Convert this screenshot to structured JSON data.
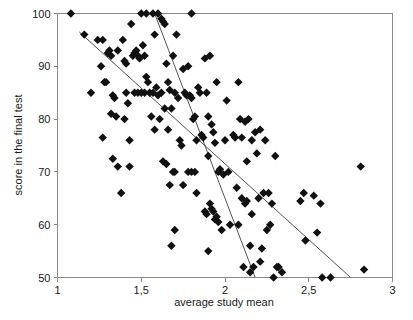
{
  "chart_data": {
    "type": "scatter",
    "title": "",
    "xlabel": "average study mean",
    "ylabel": "score in the final test",
    "xlim": [
      1,
      3
    ],
    "ylim": [
      50,
      100
    ],
    "grid": false,
    "legend": null,
    "x_ticks": [
      "1",
      "1,5",
      "2",
      "2,5",
      "3"
    ],
    "x_tick_values": [
      1,
      1.5,
      2,
      2.5,
      3
    ],
    "y_ticks": [
      "50",
      "60",
      "70",
      "80",
      "90",
      "100"
    ],
    "y_tick_values": [
      50,
      60,
      70,
      80,
      90,
      100
    ],
    "marker": "diamond",
    "marker_color": "#111111",
    "marker_size": 4.2,
    "series": [
      {
        "name": "students",
        "points": [
          [
            1.08,
            100.0
          ],
          [
            1.16,
            96.0
          ],
          [
            1.2,
            85.0
          ],
          [
            1.24,
            95.0
          ],
          [
            1.26,
            90.0
          ],
          [
            1.27,
            95.0
          ],
          [
            1.28,
            87.0
          ],
          [
            1.29,
            87.0
          ],
          [
            1.27,
            76.5
          ],
          [
            1.3,
            92.5
          ],
          [
            1.31,
            93.0
          ],
          [
            1.32,
            92.0
          ],
          [
            1.32,
            81.0
          ],
          [
            1.33,
            84.5
          ],
          [
            1.34,
            84.0
          ],
          [
            1.33,
            72.5
          ],
          [
            1.35,
            80.5
          ],
          [
            1.36,
            93.0
          ],
          [
            1.36,
            71.0
          ],
          [
            1.38,
            66.0
          ],
          [
            1.39,
            95.0
          ],
          [
            1.4,
            91.0
          ],
          [
            1.4,
            80.0
          ],
          [
            1.41,
            90.5
          ],
          [
            1.41,
            85.0
          ],
          [
            1.42,
            83.0
          ],
          [
            1.43,
            76.0
          ],
          [
            1.43,
            71.0
          ],
          [
            1.44,
            98.0
          ],
          [
            1.45,
            92.0
          ],
          [
            1.46,
            92.5
          ],
          [
            1.46,
            85.0
          ],
          [
            1.47,
            93.0
          ],
          [
            1.48,
            92.0
          ],
          [
            1.48,
            85.0
          ],
          [
            1.49,
            91.5
          ],
          [
            1.5,
            100.0
          ],
          [
            1.5,
            85.0
          ],
          [
            1.51,
            94.0
          ],
          [
            1.52,
            92.0
          ],
          [
            1.52,
            85.0
          ],
          [
            1.53,
            100.0
          ],
          [
            1.53,
            88.0
          ],
          [
            1.54,
            87.0
          ],
          [
            1.55,
            85.0
          ],
          [
            1.56,
            80.5
          ],
          [
            1.57,
            100.0
          ],
          [
            1.57,
            85.0
          ],
          [
            1.58,
            96.0
          ],
          [
            1.58,
            78.0
          ],
          [
            1.59,
            86.0
          ],
          [
            1.6,
            100.0
          ],
          [
            1.6,
            84.5
          ],
          [
            1.61,
            80.0
          ],
          [
            1.62,
            99.0
          ],
          [
            1.62,
            85.0
          ],
          [
            1.63,
            98.5
          ],
          [
            1.63,
            72.0
          ],
          [
            1.64,
            98.0
          ],
          [
            1.64,
            82.0
          ],
          [
            1.65,
            90.5
          ],
          [
            1.65,
            71.5
          ],
          [
            1.66,
            87.0
          ],
          [
            1.66,
            78.0
          ],
          [
            1.67,
            85.5
          ],
          [
            1.67,
            67.5
          ],
          [
            1.68,
            82.0
          ],
          [
            1.68,
            56.0
          ],
          [
            1.69,
            92.0
          ],
          [
            1.69,
            70.0
          ],
          [
            1.7,
            85.0
          ],
          [
            1.7,
            70.0
          ],
          [
            1.7,
            59.0
          ],
          [
            1.71,
            96.0
          ],
          [
            1.72,
            84.0
          ],
          [
            1.73,
            76.0
          ],
          [
            1.74,
            75.0
          ],
          [
            1.75,
            89.5
          ],
          [
            1.75,
            67.5
          ],
          [
            1.76,
            85.0
          ],
          [
            1.77,
            84.5
          ],
          [
            1.78,
            90.0
          ],
          [
            1.78,
            70.0
          ],
          [
            1.79,
            84.5
          ],
          [
            1.8,
            100.0
          ],
          [
            1.8,
            84.0
          ],
          [
            1.8,
            70.0
          ],
          [
            1.81,
            80.0
          ],
          [
            1.82,
            80.5
          ],
          [
            1.82,
            70.0
          ],
          [
            1.83,
            76.0
          ],
          [
            1.83,
            66.0
          ],
          [
            1.84,
            86.0
          ],
          [
            1.85,
            85.0
          ],
          [
            1.86,
            77.0
          ],
          [
            1.87,
            76.5
          ],
          [
            1.88,
            91.5
          ],
          [
            1.88,
            62.5
          ],
          [
            1.89,
            85.0
          ],
          [
            1.89,
            62.0
          ],
          [
            1.9,
            80.5
          ],
          [
            1.9,
            73.0
          ],
          [
            1.9,
            55.0
          ],
          [
            1.91,
            92.0
          ],
          [
            1.91,
            64.0
          ],
          [
            1.92,
            79.0
          ],
          [
            1.92,
            63.0
          ],
          [
            1.93,
            77.5
          ],
          [
            1.93,
            62.5
          ],
          [
            1.94,
            75.5
          ],
          [
            1.94,
            61.0
          ],
          [
            1.95,
            87.0
          ],
          [
            1.95,
            61.5
          ],
          [
            1.96,
            70.0
          ],
          [
            1.96,
            60.5
          ],
          [
            1.97,
            70.5
          ],
          [
            1.98,
            59.0
          ],
          [
            1.99,
            69.5
          ],
          [
            2.0,
            76.0
          ],
          [
            2.01,
            83.5
          ],
          [
            2.02,
            70.0
          ],
          [
            2.03,
            60.0
          ],
          [
            2.05,
            77.0
          ],
          [
            2.06,
            76.5
          ],
          [
            2.07,
            67.0
          ],
          [
            2.08,
            87.0
          ],
          [
            2.08,
            60.0
          ],
          [
            2.09,
            80.0
          ],
          [
            2.1,
            76.5
          ],
          [
            2.1,
            65.0
          ],
          [
            2.11,
            52.0
          ],
          [
            2.12,
            79.5
          ],
          [
            2.12,
            64.0
          ],
          [
            2.13,
            72.0
          ],
          [
            2.13,
            64.5
          ],
          [
            2.14,
            80.0
          ],
          [
            2.15,
            56.0
          ],
          [
            2.15,
            51.0
          ],
          [
            2.16,
            76.0
          ],
          [
            2.16,
            62.0
          ],
          [
            2.17,
            52.0
          ],
          [
            2.18,
            77.5
          ],
          [
            2.19,
            73.5
          ],
          [
            2.2,
            65.0
          ],
          [
            2.21,
            78.0
          ],
          [
            2.21,
            53.0
          ],
          [
            2.22,
            55.5
          ],
          [
            2.23,
            66.0
          ],
          [
            2.24,
            76.0
          ],
          [
            2.25,
            59.0
          ],
          [
            2.26,
            66.0
          ],
          [
            2.27,
            60.0
          ],
          [
            2.28,
            64.0
          ],
          [
            2.29,
            50.0
          ],
          [
            2.3,
            73.0
          ],
          [
            2.31,
            52.0
          ],
          [
            2.32,
            52.0
          ],
          [
            2.34,
            51.0
          ],
          [
            2.45,
            64.5
          ],
          [
            2.47,
            66.0
          ],
          [
            2.48,
            57.0
          ],
          [
            2.53,
            65.5
          ],
          [
            2.55,
            58.5
          ],
          [
            2.57,
            64.0
          ],
          [
            2.58,
            50.0
          ],
          [
            2.63,
            50.0
          ],
          [
            2.81,
            71.0
          ],
          [
            2.83,
            51.5
          ]
        ]
      }
    ],
    "trend_lines": [
      {
        "name": "shallow-regression-line",
        "x0": 1.13,
        "y0": 96.5,
        "x1": 2.75,
        "y1": 50.0
      },
      {
        "name": "steep-regression-line",
        "x0": 1.58,
        "y0": 100.0,
        "x1": 2.18,
        "y1": 50.0
      }
    ]
  },
  "axes": {
    "x_title": "average study mean",
    "y_title": "score in the final test"
  }
}
